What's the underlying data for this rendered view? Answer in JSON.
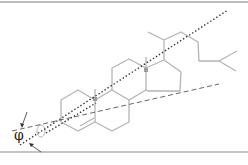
{
  "diagram": {
    "angle_label": "φ",
    "lines": [
      {
        "name": "molecular-long-axis",
        "style": "dotted"
      },
      {
        "name": "reference-axis",
        "style": "dashed"
      }
    ],
    "colors": {
      "bonds": "#b4b4b4",
      "dotted_axis": "#333333",
      "dashed_axis": "#555555",
      "frame": "#bdbdbd",
      "methyl_marker": "#999999"
    }
  }
}
